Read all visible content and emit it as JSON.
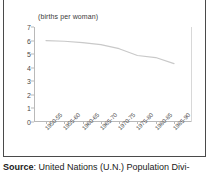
{
  "figure": {
    "units_label": "(births per woman)"
  },
  "chart_data": {
    "type": "line",
    "title": "",
    "subtitle": "",
    "xlabel": "",
    "ylabel": "(births per woman)",
    "categories": [
      "1950-55",
      "1955-60",
      "1960-65",
      "1965-70",
      "1970-75",
      "1975-80",
      "1980-85",
      "1985-90"
    ],
    "values": [
      6.0,
      5.95,
      5.85,
      5.7,
      5.4,
      4.9,
      4.75,
      4.3
    ],
    "ylim": [
      0,
      7
    ],
    "yticks": [
      0,
      1,
      2,
      3,
      4,
      5,
      6,
      7
    ],
    "grid": false,
    "legend": false,
    "series_color": "#c9c9c9"
  },
  "source": {
    "label": "Source",
    "separator": ":",
    "text": "United Nations (U.N.) Population Divi-"
  }
}
